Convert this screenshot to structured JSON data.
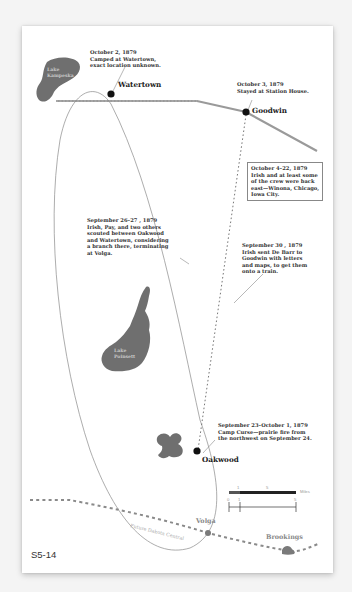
{
  "figure": {
    "label": "S5-14"
  },
  "towns": [
    {
      "name": "Watertown"
    },
    {
      "name": "Goodwin"
    },
    {
      "name": "Oakwood"
    },
    {
      "name": "Volga"
    },
    {
      "name": "Brookings"
    }
  ],
  "lakes": [
    {
      "name": "Lake\nKampeska"
    },
    {
      "name": "Lake\nPoinsett"
    }
  ],
  "roads": {
    "future_road_label": "Future Dakota Central"
  },
  "notes": {
    "watertown": "October 2, 1879\nCamped at Watertown,\nexact location unknown.",
    "goodwin": "October 3, 1879\nStayed at Station House.",
    "back_east": "October 4–22, 1879\nIrish and at least some\nof the crew were back\neast—Winona, Chicago,\nIowa City.",
    "scouting": "September 26–27 , 1879\nIrish, Pay, and two others\nscouted between Oakwood\nand Watertown, considering\na branch there, terminating\nat Volga.",
    "debarr": "September 30 , 1879\nIrish sent De Barr to\nGoodwin with letters\nand maps, to get them\nonto a train.",
    "camp_curse": "September 23–October 1, 1879\nCamp Curse—prairie fire from\nthe northwest on September 24."
  },
  "scale": {
    "unit_label": "Miles",
    "top_ticks": [
      "1",
      "5"
    ],
    "bottom_ticks": [
      "0",
      "1",
      "5"
    ]
  },
  "colors": {
    "lake": "#6f6f6f",
    "railroad": "#9a9a9a",
    "dashed_road": "#8a8a8a",
    "route_line": "#888888",
    "town_dot": "#111111"
  }
}
